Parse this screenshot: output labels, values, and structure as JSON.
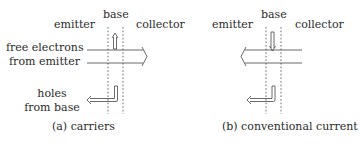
{
  "panel_a": {
    "caption": "(a)  carriers",
    "labels": {
      "emitter": "emitter",
      "base": "base",
      "collector": "collector",
      "electrons_line1": "free electrons",
      "electrons_line2": "from emitter",
      "holes_line1": "holes",
      "holes_line2": "from base"
    }
  },
  "panel_b": {
    "caption": "(b)  conventional current",
    "labels": {
      "emitter": "emitter",
      "base": "base",
      "collector": "collector"
    }
  },
  "colors": {
    "line": "#444444",
    "text": "#2a2a2a"
  }
}
